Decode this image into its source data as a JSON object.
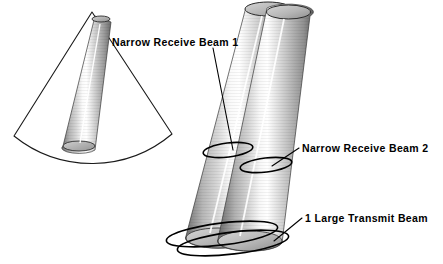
{
  "figure": {
    "background_color": "#ffffff",
    "title": "",
    "labels": [
      {
        "id": "narrow-receive-beam-1",
        "text": "Narrow Receive Beam 1",
        "x": 112,
        "y": 46,
        "leader_from": [
          213,
          48
        ],
        "leader_to": [
          233,
          150
        ]
      },
      {
        "id": "narrow-receive-beam-2",
        "text": "Narrow Receive Beam 2",
        "x": 302,
        "y": 152,
        "leader_from": [
          299,
          148
        ],
        "leader_to": [
          272,
          166
        ]
      },
      {
        "id": "one-large-transmit-beam",
        "text": "1 Large Transmit Beam",
        "x": 305,
        "y": 222,
        "leader_from": [
          302,
          218
        ],
        "leader_to": [
          274,
          241
        ]
      }
    ],
    "shapes": {
      "left_group": {
        "name": "left-beam-pair",
        "wide_cone": {
          "name": "large-transmit-beam-cone-outline",
          "apex": [
            92,
            12
          ],
          "base_left": [
            14,
            136
          ],
          "base_right": [
            172,
            134
          ],
          "style": "outline-only",
          "stroke": "#1a1a1a"
        },
        "narrow_cone": {
          "name": "narrow-receive-beam-cone-shaded",
          "apex": [
            95,
            16
          ],
          "base_center": [
            79,
            146
          ],
          "base_rx": 16,
          "base_ry": 5,
          "style": "shaded-gradient"
        }
      },
      "right_group": {
        "name": "right-beam-pair",
        "cone_a": {
          "name": "narrow-receive-beam-1-cone",
          "apex_center": [
            268,
            9
          ],
          "apex_rx": 23,
          "apex_ry": 7,
          "base_center": [
            218,
            238
          ],
          "base_rx": 32,
          "base_ry": 10,
          "ring": {
            "cx": 228,
            "cy": 150,
            "rx": 25,
            "ry": 7
          }
        },
        "cone_b": {
          "name": "narrow-receive-beam-2-cone",
          "apex_center": [
            288,
            12
          ],
          "apex_rx": 22,
          "apex_ry": 7,
          "base_center": [
            250,
            241
          ],
          "base_rx": 32,
          "base_ry": 10,
          "ring": {
            "cx": 266,
            "cy": 165,
            "rx": 26,
            "ry": 7
          }
        },
        "transmit_rings": [
          {
            "name": "transmit-beam-ring-front",
            "cx": 222,
            "cy": 235,
            "rx": 56,
            "ry": 11,
            "rot": -7
          },
          {
            "name": "transmit-beam-ring-back",
            "cx": 232,
            "cy": 243,
            "rx": 56,
            "ry": 11,
            "rot": -7
          }
        ]
      }
    },
    "colors": {
      "ink": "#000000",
      "outline": "#1a1a1a",
      "cone_dark": "#5f5f5f",
      "cone_mid": "#9a9a9a",
      "cone_light": "#e8e8e8",
      "cone_highlight": "#fbfbfb",
      "cap_fill": "#c9c9c9"
    }
  }
}
